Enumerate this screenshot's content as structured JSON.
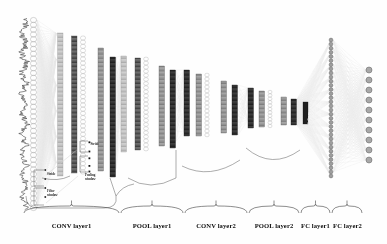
{
  "figure": {
    "background": "#fefefe"
  },
  "colors": {
    "signal": "#2b2b2b",
    "neuron_outline": "#8a8a8a",
    "feature_map_light": "#b9b9b9",
    "feature_map_dark": "#4a4a4a",
    "feature_map_black": "#1c1c1c",
    "connection": "#d7d7d7",
    "brace": "#333333",
    "label": "#0d0d0d"
  },
  "input": {
    "name": "input-signal",
    "type": "waveform",
    "orientation": "vertical",
    "neuron_count": 40
  },
  "annotations": [
    {
      "id": "stride-input",
      "text": "Stride",
      "lines": [
        "Stride"
      ]
    },
    {
      "id": "filter-window-input",
      "text": "Filter window",
      "lines": [
        "Filter",
        "window"
      ]
    },
    {
      "id": "stride-pool",
      "text": "Stride",
      "lines": [
        "Stride"
      ]
    },
    {
      "id": "pooling-window",
      "text": "Pooling window",
      "lines": [
        "Pooling",
        "window"
      ]
    },
    {
      "id": "softmax",
      "text": "Softmax"
    }
  ],
  "layers": [
    {
      "id": "conv-layer-1",
      "label": "CONV layer1",
      "kind": "conv",
      "brace_x": 24,
      "brace_w": 95,
      "label_x": 71.5
    },
    {
      "id": "pool-layer-1",
      "label": "POOL layer1",
      "kind": "pool",
      "brace_x": 121,
      "brace_w": 62,
      "label_x": 152
    },
    {
      "id": "conv-layer-2",
      "label": "CONV layer2",
      "kind": "conv",
      "brace_x": 185,
      "brace_w": 62,
      "label_x": 216
    },
    {
      "id": "pool-layer-2",
      "label": "POOL layer2",
      "kind": "pool",
      "brace_x": 249,
      "brace_w": 50,
      "label_x": 274
    },
    {
      "id": "fc-layer-1",
      "label": "FC layer1",
      "kind": "fc",
      "brace_x": 301,
      "brace_w": 29,
      "label_x": 315.5
    },
    {
      "id": "fc-layer-2",
      "label": "FC layer2",
      "kind": "fc-out",
      "brace_x": 332,
      "brace_w": 30,
      "label_x": 347
    }
  ],
  "chart_data": {
    "type": "diagram",
    "stages": [
      {
        "name": "Input",
        "representation": "1D waveform + neuron column",
        "units": 40
      },
      {
        "name": "CONV layer1",
        "representation": "feature maps",
        "maps": 4
      },
      {
        "name": "POOL layer1",
        "representation": "feature maps",
        "maps": 4
      },
      {
        "name": "CONV layer2",
        "representation": "feature maps",
        "maps": 4
      },
      {
        "name": "POOL layer2",
        "representation": "feature maps",
        "maps": 4
      },
      {
        "name": "FC layer1",
        "representation": "neuron column",
        "units": 34
      },
      {
        "name": "FC layer2",
        "representation": "output neurons",
        "units": 10
      }
    ]
  }
}
